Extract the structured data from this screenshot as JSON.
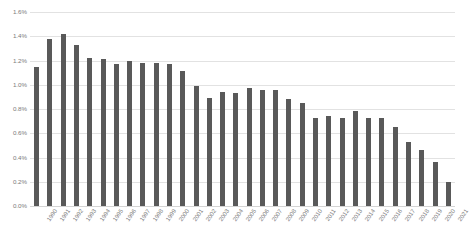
{
  "chart_data": {
    "type": "bar",
    "title": "",
    "subtitle": "",
    "xlabel": "",
    "ylabel": "",
    "ylim": [
      0,
      1.6
    ],
    "yticks": [
      "0.0%",
      "0.2%",
      "0.4%",
      "0.6%",
      "0.8%",
      "1.0%",
      "1.2%",
      "1.4%",
      "1.6%"
    ],
    "ytick_values": [
      0.0,
      0.2,
      0.4,
      0.6,
      0.8,
      1.0,
      1.2,
      1.4,
      1.6
    ],
    "grid": true,
    "legend": false,
    "legend_position": "none",
    "bar_color": "#595959",
    "gridline_color": "#E2E2E2",
    "tick_label_color": "#7B7B7B",
    "categories": [
      "1990",
      "1991",
      "1992",
      "1993",
      "1994",
      "1995",
      "1996",
      "1997",
      "1998",
      "1999",
      "2000",
      "2001",
      "2002",
      "2003",
      "2004",
      "2005",
      "2006",
      "2007",
      "2008",
      "2009",
      "2010",
      "2011",
      "2012",
      "2013",
      "2014",
      "2015",
      "2016",
      "2017",
      "2018",
      "2019",
      "2020",
      "2021"
    ],
    "values": [
      1.15,
      1.38,
      1.42,
      1.33,
      1.22,
      1.21,
      1.17,
      1.2,
      1.18,
      1.18,
      1.17,
      1.11,
      0.99,
      0.89,
      0.94,
      0.93,
      0.97,
      0.96,
      0.96,
      0.88,
      0.85,
      0.73,
      0.74,
      0.73,
      0.78,
      0.73,
      0.73,
      0.65,
      0.53,
      0.46,
      0.36,
      0.2
    ]
  }
}
